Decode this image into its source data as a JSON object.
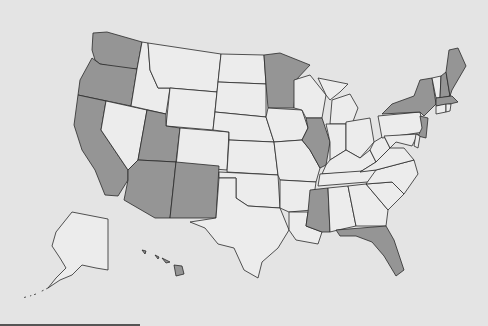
{
  "map": {
    "title": "United States choropleth map",
    "colors": {
      "highlighted": "#959595",
      "default": "#ececec",
      "border": "#2a2a2a",
      "background": "#e4e4e4"
    },
    "highlighted_states": [
      "WA",
      "OR",
      "CA",
      "UT",
      "AZ",
      "NM",
      "MN",
      "IL",
      "MS",
      "FL",
      "NY",
      "NJ",
      "MA",
      "NH",
      "ME",
      "HI"
    ],
    "states": [
      {
        "id": "WA",
        "d": "M93,33 L107,32 L142,42 L137,69 L120,68 L100,64 L95,60 L92,50 Z"
      },
      {
        "id": "OR",
        "d": "M92,58 L100,64 L137,69 L131,106 L78,95 L80,80 Z"
      },
      {
        "id": "CA",
        "d": "M78,95 L106,101 L101,130 L128,170 L128,180 L118,196 L105,195 L95,170 L82,150 L74,125 Z"
      },
      {
        "id": "NV",
        "d": "M106,101 L147,110 L138,160 L128,170 L101,130 Z"
      },
      {
        "id": "ID",
        "d": "M142,42 L148,43 L150,70 L158,88 L170,88 L166,114 L131,106 L137,69 Z"
      },
      {
        "id": "MT",
        "d": "M148,43 L221,54 L217,92 L170,88 L158,88 L150,70 Z"
      },
      {
        "id": "WY",
        "d": "M170,88 L217,92 L213,130 L166,126 Z"
      },
      {
        "id": "UT",
        "d": "M147,110 L166,114 L166,126 L180,128 L176,162 L138,160 Z"
      },
      {
        "id": "CO",
        "d": "M180,128 L229,132 L227,170 L176,166 Z"
      },
      {
        "id": "AZ",
        "d": "M138,160 L176,162 L170,218 L155,218 L124,200 L128,180 L128,170 Z"
      },
      {
        "id": "NM",
        "d": "M176,162 L219,166 L216,218 L170,218 Z"
      },
      {
        "id": "ND",
        "d": "M221,54 L264,55 L266,84 L218,82 Z"
      },
      {
        "id": "SD",
        "d": "M218,82 L266,84 L266,117 L215,112 Z"
      },
      {
        "id": "NE",
        "d": "M215,112 L266,117 L274,142 L229,140 L229,132 L213,130 Z"
      },
      {
        "id": "KS",
        "d": "M229,140 L274,142 L278,175 L227,172 Z"
      },
      {
        "id": "OK",
        "d": "M219,172 L278,175 L280,208 L248,206 L236,198 L236,178 L219,178 Z"
      },
      {
        "id": "TX",
        "d": "M219,178 L236,178 L236,198 L248,206 L280,208 L289,230 L278,248 L262,262 L258,278 L244,270 L234,248 L218,244 L205,228 L190,222 L216,218 Z"
      },
      {
        "id": "MN",
        "d": "M264,55 L280,53 L310,65 L296,80 L294,108 L268,108 L266,84 Z"
      },
      {
        "id": "IA",
        "d": "M268,108 L302,110 L308,128 L302,140 L274,142 L266,117 Z"
      },
      {
        "id": "MO",
        "d": "M274,142 L302,140 L310,150 L320,168 L316,182 L280,180 L278,175 Z"
      },
      {
        "id": "AR",
        "d": "M280,180 L316,182 L312,210 L289,212 L280,208 Z"
      },
      {
        "id": "LA",
        "d": "M289,212 L308,212 L306,226 L322,232 L318,244 L296,240 L289,230 Z"
      },
      {
        "id": "WI",
        "d": "M294,80 L310,75 L326,95 L322,118 L306,118 L302,110 L294,108 Z"
      },
      {
        "id": "IL",
        "d": "M306,118 L322,118 L330,142 L326,165 L320,168 L310,150 L302,140 L308,128 Z"
      },
      {
        "id": "MI",
        "d": "M318,78 L348,84 L340,92 L330,100 L326,95 Z M332,100 L350,94 L358,108 L352,124 L330,124 Z"
      },
      {
        "id": "IN",
        "d": "M326,124 L346,124 L346,150 L330,160 L330,142 Z"
      },
      {
        "id": "OH",
        "d": "M346,122 L370,118 L374,142 L360,158 L346,150 Z"
      },
      {
        "id": "KY",
        "d": "M326,165 L330,160 L346,150 L360,158 L370,150 L376,162 L360,172 L322,174 Z"
      },
      {
        "id": "TN",
        "d": "M320,174 L376,170 L402,166 L392,180 L318,186 Z"
      },
      {
        "id": "MS",
        "d": "M310,190 L328,188 L330,232 L322,232 L306,226 L308,212 Z"
      },
      {
        "id": "AL",
        "d": "M328,188 L348,186 L356,226 L338,230 L330,232 Z"
      },
      {
        "id": "GA",
        "d": "M348,186 L366,184 L388,210 L386,226 L356,226 Z"
      },
      {
        "id": "FL",
        "d": "M336,230 L386,226 L394,240 L404,270 L396,276 L384,256 L372,242 L356,236 L340,236 Z"
      },
      {
        "id": "SC",
        "d": "M366,184 L392,182 L404,194 L388,210 Z"
      },
      {
        "id": "NC",
        "d": "M376,170 L414,160 L418,174 L404,194 L392,182 L366,184 Z"
      },
      {
        "id": "VA",
        "d": "M360,172 L376,162 L390,148 L404,148 L414,160 L376,170 Z"
      },
      {
        "id": "WV",
        "d": "M370,150 L374,142 L384,136 L390,148 L376,162 Z"
      },
      {
        "id": "PA",
        "d": "M378,116 L420,112 L424,132 L382,138 Z"
      },
      {
        "id": "NY",
        "d": "M382,114 L392,104 L414,96 L420,80 L432,78 L436,104 L424,116 L420,112 Z"
      },
      {
        "id": "NJ",
        "d": "M420,116 L428,118 L426,138 L418,136 L422,128 Z"
      },
      {
        "id": "MD",
        "d": "M384,136 L418,134 L412,146 L396,142 L390,148 Z"
      },
      {
        "id": "DE",
        "d": "M416,134 L420,136 L418,148 L414,146 Z"
      },
      {
        "id": "VT",
        "d": "M432,78 L441,76 L440,98 L436,98 Z"
      },
      {
        "id": "NH",
        "d": "M441,76 L446,72 L450,96 L440,98 Z"
      },
      {
        "id": "ME",
        "d": "M446,72 L449,50 L458,48 L466,66 L452,90 L450,96 Z"
      },
      {
        "id": "MA",
        "d": "M436,98 L452,96 L458,102 L450,104 L436,106 Z"
      },
      {
        "id": "CT",
        "d": "M436,106 L446,104 L446,112 L436,114 Z"
      },
      {
        "id": "RI",
        "d": "M446,104 L451,104 L450,111 L446,112 Z"
      },
      {
        "id": "AK",
        "d": "M72,212 L108,219 L108,270 L96,268 L82,265 L72,275 L60,280 L48,288 L56,278 L66,268 L60,258 L52,246 L56,232 Z"
      },
      {
        "id": "HI",
        "d": "M174,265 L182,266 L184,274 L176,276 Z M142,250 L146,251 L145,254 Z M155,255 L159,257 L158,259 Z M162,258 L170,262 L166,263 Z"
      }
    ],
    "alaska_islands": "M48,288 L40,292 M36,294 L30,296 M26,297 L22,298"
  }
}
